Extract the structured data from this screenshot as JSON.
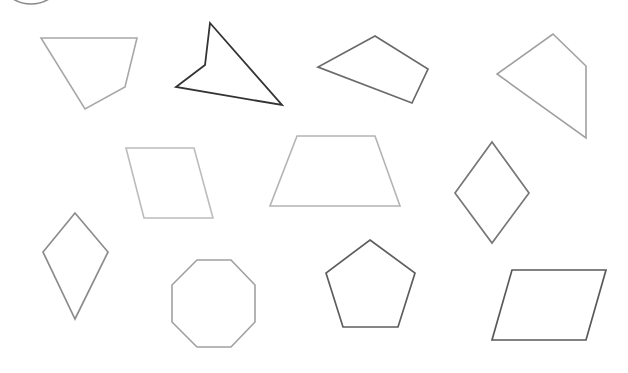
{
  "diagram": {
    "type": "polygon worksheet",
    "width": 628,
    "height": 373,
    "background": "#ffffff",
    "decorations": [
      {
        "name": "partial-circle-arc",
        "shape": "arc",
        "cx": 31,
        "cy": -30,
        "r": 34,
        "stroke": "#8a8a8a",
        "stroke_width": 1.6
      }
    ],
    "shapes": [
      {
        "name": "irregular-quadrilateral-1",
        "kind": "pentagon-like quadrilateral",
        "points": "41,38 137,38 125,87 85,109",
        "stroke": "#a8a8a8",
        "stroke_width": 1.6
      },
      {
        "name": "concave-quadrilateral",
        "kind": "concave quadrilateral (arrowhead)",
        "points": "210,23 205,65 176,87 282,105",
        "stroke": "#333333",
        "stroke_width": 1.8
      },
      {
        "name": "irregular-quadrilateral-2",
        "kind": "quadrilateral",
        "points": "375,36 428,69 412,103 318,67",
        "stroke": "#6a6a6a",
        "stroke_width": 1.7
      },
      {
        "name": "irregular-quadrilateral-3",
        "kind": "quadrilateral",
        "points": "553,34 586,66 586,138 497,74",
        "stroke": "#a0a0a0",
        "stroke_width": 1.6
      },
      {
        "name": "parallelogram-1",
        "kind": "parallelogram",
        "points": "126,148 194,148 213,218 144,218",
        "stroke": "#bcbcbc",
        "stroke_width": 1.6
      },
      {
        "name": "trapezoid",
        "kind": "isosceles trapezoid",
        "points": "297,136 375,136 400,206 270,206",
        "stroke": "#b4b4b4",
        "stroke_width": 1.6
      },
      {
        "name": "rhombus",
        "kind": "rhombus",
        "points": "492,142 529,193 492,243 455,193",
        "stroke": "#777777",
        "stroke_width": 1.7
      },
      {
        "name": "kite",
        "kind": "kite",
        "points": "75,213 108,252 75,319 43,252",
        "stroke": "#8c8c8c",
        "stroke_width": 1.7
      },
      {
        "name": "octagon",
        "kind": "regular octagon",
        "points": "197,260 231,260 255,285 255,322 231,347 197,347 172,322 172,285",
        "stroke": "#a0a0a0",
        "stroke_width": 1.6
      },
      {
        "name": "pentagon",
        "kind": "regular pentagon",
        "points": "370,240 415,273 398,327 343,327 326,273",
        "stroke": "#5e5e5e",
        "stroke_width": 1.7
      },
      {
        "name": "parallelogram-2",
        "kind": "parallelogram",
        "points": "512,270 606,270 586,340 492,340",
        "stroke": "#5a5a5a",
        "stroke_width": 1.7
      }
    ]
  }
}
